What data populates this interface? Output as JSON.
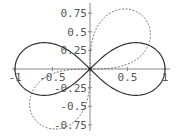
{
  "chart_data": {
    "type": "line",
    "title": "",
    "xlabel": "",
    "ylabel": "",
    "xlim": [
      -1,
      1
    ],
    "ylim": [
      -0.85,
      0.85
    ],
    "grid": false,
    "legend": null,
    "x_ticks": [
      -1,
      -0.5,
      0.5,
      1
    ],
    "x_tick_labels": [
      "-1",
      "-0.5",
      "0.5",
      "1"
    ],
    "y_ticks": [
      0.75,
      0.5,
      0.25,
      -0.25,
      -0.5,
      -0.75
    ],
    "y_tick_labels": [
      "0.75",
      "0.5",
      "0.25",
      "-0.25",
      "-0.5",
      "-0.75"
    ],
    "series": [
      {
        "name": "lemniscate (r^2 = cos 2θ)",
        "style": "solid",
        "color": "#333333",
        "equation": "r^2 = cos(2θ)",
        "rotation_deg": 0,
        "key_points": [
          [
            -1,
            0
          ],
          [
            -0.61,
            0.354
          ],
          [
            0,
            0
          ],
          [
            0.61,
            0.354
          ],
          [
            1,
            0
          ],
          [
            0.61,
            -0.354
          ],
          [
            -0.61,
            -0.354
          ]
        ]
      },
      {
        "name": "rotated lemniscate (r^2 = sin 2θ)",
        "style": "dashed",
        "color": "#666666",
        "equation": "r^2 = sin(2θ)",
        "rotation_deg": 45,
        "key_points": [
          [
            0,
            0
          ],
          [
            0.354,
            0.61
          ],
          [
            0.707,
            0.707
          ],
          [
            0.61,
            0.354
          ],
          [
            -0.707,
            -0.707
          ],
          [
            -0.354,
            -0.61
          ],
          [
            -0.61,
            -0.354
          ]
        ]
      }
    ]
  },
  "axes": {
    "color": "#888888"
  }
}
